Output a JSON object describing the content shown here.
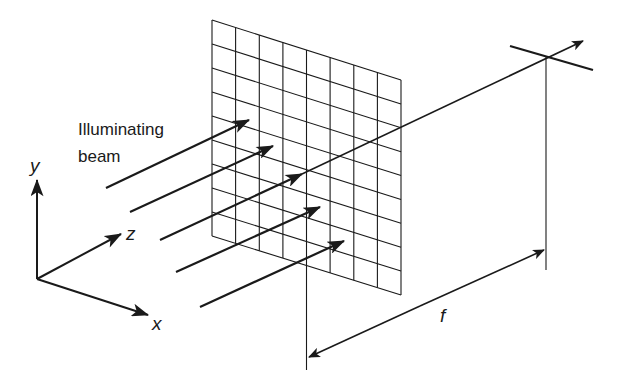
{
  "diagram": {
    "type": "optical-fourier-transform-setup",
    "labels": {
      "beam_line1": "Illuminating",
      "beam_line2": "beam",
      "axis_x": "x",
      "axis_y": "y",
      "axis_z": "z",
      "focal_length": "f"
    },
    "grid": {
      "columns": 8,
      "rows": 9,
      "top_left": [
        212,
        20
      ],
      "top_right": [
        401,
        80
      ],
      "bottom_left": [
        212,
        236
      ],
      "bottom_right": [
        401,
        295
      ]
    },
    "beams": [
      {
        "start": [
          106,
          188
        ],
        "tip": [
          249,
          120
        ]
      },
      {
        "start": [
          130,
          212
        ],
        "tip": [
          273,
          146
        ]
      },
      {
        "start": [
          160,
          240
        ],
        "tip": [
          302,
          174
        ]
      },
      {
        "start": [
          176,
          272
        ],
        "tip": [
          320,
          207
        ]
      },
      {
        "start": [
          200,
          307
        ],
        "tip": [
          344,
          241
        ]
      }
    ],
    "optical_axis": {
      "start": [
        160,
        240
      ],
      "end": [
        583,
        41
      ]
    },
    "focal_plane": {
      "start": [
        510,
        46
      ],
      "end": [
        593,
        70
      ],
      "center": [
        546,
        57
      ]
    },
    "colors": {
      "line": "#1a1a1a",
      "background": "#ffffff"
    }
  }
}
